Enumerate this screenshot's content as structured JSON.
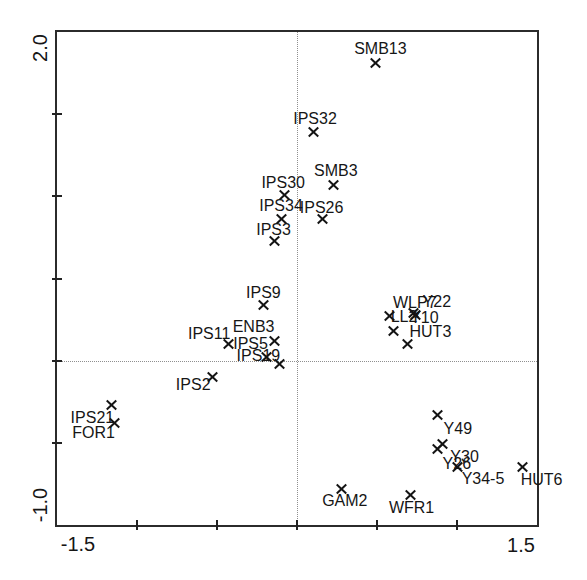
{
  "colors": {
    "marker": "#141414",
    "frame": "#2b2b2b",
    "dotted_line": "#8f8f8f",
    "text": "#161616",
    "background": "#ffffff"
  },
  "chart_data": {
    "type": "scatter",
    "title": "",
    "marker_symbol": "x",
    "grid": false,
    "legend": false,
    "origin_lines": {
      "x": 0,
      "y": 0,
      "style": "dotted"
    },
    "x_axis": {
      "min": -1.5,
      "max": 1.5,
      "min_label": "-1.5",
      "max_label": "1.5",
      "ticks": [
        -1.0,
        -0.5,
        0.0,
        0.5,
        1.0
      ]
    },
    "y_axis": {
      "min": -1.0,
      "max": 2.0,
      "min_label": "-1.0",
      "max_label": "2.0",
      "ticks": [
        1.5,
        1.0,
        0.5,
        0.0,
        -0.5
      ]
    },
    "points": [
      {
        "label": "SMB13",
        "x": 0.49,
        "y": 1.81,
        "dx": 5,
        "dy": -14
      },
      {
        "label": "IPS32",
        "x": 0.1,
        "y": 1.39,
        "dx": 2,
        "dy": -13
      },
      {
        "label": "SMB3",
        "x": 0.23,
        "y": 1.07,
        "dx": 2,
        "dy": -14
      },
      {
        "label": "IPS30",
        "x": -0.08,
        "y": 1.01,
        "dx": -1,
        "dy": -12
      },
      {
        "label": "IPS34",
        "x": -0.1,
        "y": 0.86,
        "dx": 0,
        "dy": -13
      },
      {
        "label": "IPS26",
        "x": 0.16,
        "y": 0.86,
        "dx": -1,
        "dy": -11
      },
      {
        "label": "IPS3",
        "x": -0.14,
        "y": 0.73,
        "dx": -1,
        "dy": -11
      },
      {
        "label": "IPS9",
        "x": -0.21,
        "y": 0.34,
        "dx": 0,
        "dy": -12
      },
      {
        "label": "IPS11",
        "x": -0.43,
        "y": 0.1,
        "dx": -19,
        "dy": -10
      },
      {
        "label": "ENB3",
        "x": -0.14,
        "y": 0.12,
        "dx": -21,
        "dy": -14
      },
      {
        "label": "IPS5",
        "x": -0.19,
        "y": 0.02,
        "dx": -16,
        "dy": -13
      },
      {
        "label": "IPS19",
        "x": -0.11,
        "y": -0.02,
        "dx": -21,
        "dy": -8
      },
      {
        "label": "IPS2",
        "x": -0.53,
        "y": -0.1,
        "dx": -19,
        "dy": 8
      },
      {
        "label": "IPS21",
        "x": -1.16,
        "y": -0.27,
        "dx": -19,
        "dy": 13
      },
      {
        "label": "FOR1",
        "x": -1.14,
        "y": -0.38,
        "dx": -21,
        "dy": 10
      },
      {
        "label": "WLP7",
        "x": 0.58,
        "y": 0.27,
        "dx": 25,
        "dy": -13
      },
      {
        "label": "Y22",
        "x": 0.73,
        "y": 0.29,
        "dx": 23,
        "dy": -11
      },
      {
        "label": "LL2",
        "x": 0.6,
        "y": 0.18,
        "dx": 11,
        "dy": -14
      },
      {
        "label": "Y10",
        "x": 0.74,
        "y": 0.28,
        "dx": 9,
        "dy": 3
      },
      {
        "label": "HUT3",
        "x": 0.69,
        "y": 0.1,
        "dx": 23,
        "dy": -12
      },
      {
        "label": "Y49",
        "x": 0.88,
        "y": -0.33,
        "dx": 20,
        "dy": 14
      },
      {
        "label": "Y30",
        "x": 0.91,
        "y": -0.51,
        "dx": 22,
        "dy": 13
      },
      {
        "label": "Y26",
        "x": 0.88,
        "y": -0.54,
        "dx": 19,
        "dy": 15
      },
      {
        "label": "Y34-5",
        "x": 1.0,
        "y": -0.65,
        "dx": 26,
        "dy": 12
      },
      {
        "label": "HUT6",
        "x": 1.41,
        "y": -0.65,
        "dx": 19,
        "dy": 13
      },
      {
        "label": "GAM2",
        "x": 0.28,
        "y": -0.78,
        "dx": 3,
        "dy": 12
      },
      {
        "label": "WFR1",
        "x": 0.71,
        "y": -0.82,
        "dx": 1,
        "dy": 13
      }
    ]
  }
}
